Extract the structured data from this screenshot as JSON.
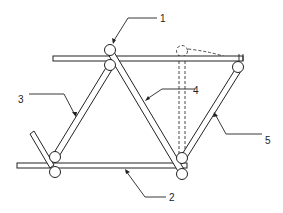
{
  "diagram": {
    "type": "truss-frame-schematic",
    "labels": [
      {
        "id": "1",
        "text": "1",
        "points_to": "top joint"
      },
      {
        "id": "2",
        "text": "2",
        "points_to": "bottom rail"
      },
      {
        "id": "3",
        "text": "3",
        "points_to": "left diagonal member"
      },
      {
        "id": "4",
        "text": "4",
        "points_to": "center diagonal member"
      },
      {
        "id": "5",
        "text": "5",
        "points_to": "right diagonal member"
      }
    ],
    "colors": {
      "stroke": "#222222",
      "background": "#ffffff"
    }
  }
}
